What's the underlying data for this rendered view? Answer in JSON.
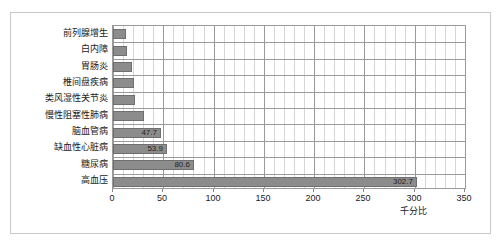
{
  "chart_data": {
    "type": "bar",
    "orientation": "horizontal",
    "title": "",
    "xlabel": "千分比",
    "ylabel": "",
    "xlim": [
      0,
      350
    ],
    "xticks": [
      0,
      50,
      100,
      150,
      200,
      250,
      300,
      350
    ],
    "tick_interval_major": 50,
    "tick_interval_minor": 10,
    "grid": true,
    "legend": false,
    "bar_color": "#8c8c8c",
    "bar_border_color": "#6f6f6f",
    "plot_border_color": "#9a9a9a",
    "minor_grid_color": "#d6d6d6",
    "frame_color": "#c9c9c9",
    "categories": [
      "前列腺增生",
      "白内障",
      "胃肠炎",
      "椎间盘疾病",
      "类风湿性关节炎",
      "慢性阻塞性肺病",
      "脑血管病",
      "缺血性心脏病",
      "糖尿病",
      "高血压"
    ],
    "values": [
      13.0,
      14.0,
      19.0,
      21.0,
      22.0,
      31.0,
      47.7,
      53.9,
      80.6,
      302.7
    ],
    "labeled_values": [
      "",
      "",
      "",
      "",
      "",
      "",
      "47.7",
      "53.9",
      "80.6",
      "302.7"
    ]
  }
}
